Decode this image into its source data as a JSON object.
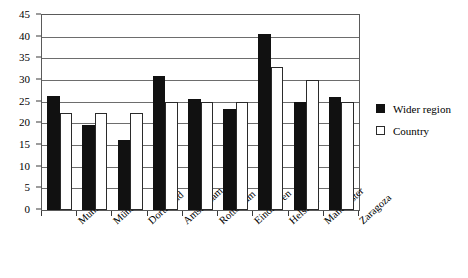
{
  "chart_data": {
    "type": "bar",
    "title": "",
    "xlabel": "",
    "ylabel": "",
    "ylim": [
      0,
      45
    ],
    "ytick_step": 5,
    "yticks": [
      0,
      5,
      10,
      15,
      20,
      25,
      30,
      35,
      40,
      45
    ],
    "grid": true,
    "legend_position": "right",
    "categories": [
      "Munich",
      "Münster",
      "Dortmund",
      "Amsterdam",
      "Rotterdam",
      "Eindhoven",
      "Helsinki",
      "Manchester",
      "Zaragoza"
    ],
    "series": [
      {
        "name": "Wider region",
        "color": "#111111",
        "values": [
          26.3,
          19.7,
          16.2,
          31.0,
          25.7,
          23.3,
          40.6,
          25.0,
          26.0
        ]
      },
      {
        "name": "Country",
        "color": "#ffffff",
        "values": [
          22.3,
          22.3,
          22.3,
          25.0,
          25.0,
          25.0,
          33.0,
          30.0,
          25.0
        ]
      }
    ]
  },
  "legend": {
    "items": [
      {
        "label": "Wider region",
        "swatch": "filled-black-square"
      },
      {
        "label": "Country",
        "swatch": "outlined-white-square"
      }
    ]
  },
  "axes": {
    "y_tick_labels": [
      "0",
      "5",
      "10",
      "15",
      "20",
      "25",
      "30",
      "35",
      "40",
      "45"
    ]
  }
}
